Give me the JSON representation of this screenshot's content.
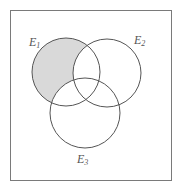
{
  "diagram": {
    "type": "venn",
    "sets": [
      {
        "id": "E1",
        "label": "E",
        "subscript": "1",
        "cx": 66,
        "cy": 72,
        "r": 34
      },
      {
        "id": "E2",
        "label": "E",
        "subscript": "2",
        "cx": 107,
        "cy": 73,
        "r": 34
      },
      {
        "id": "E3",
        "label": "E",
        "subscript": "3",
        "cx": 85,
        "cy": 113,
        "r": 35
      }
    ],
    "shaded_region": "E1 only (E1 minus E2 and E3)",
    "colors": {
      "shade": "#d9d9d9",
      "stroke": "#555555",
      "frame": "#7a7a7a",
      "background": "#ffffff"
    }
  }
}
